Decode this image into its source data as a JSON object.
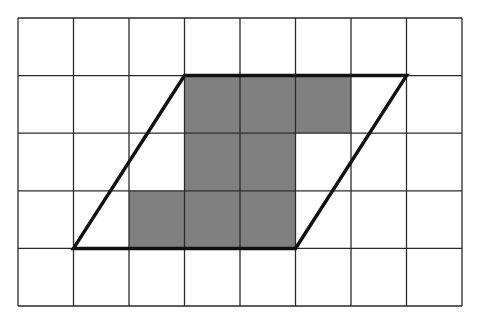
{
  "grid": {
    "cols": 8,
    "rows": 5,
    "origin_x": 18,
    "origin_y": 18,
    "cell_w": 55.5,
    "cell_h": 57.6,
    "line_color": "#2a2a2a",
    "background": "#ffffff"
  },
  "shaded_cells": [
    {
      "col": 3,
      "row": 1
    },
    {
      "col": 4,
      "row": 1
    },
    {
      "col": 5,
      "row": 1
    },
    {
      "col": 3,
      "row": 2
    },
    {
      "col": 4,
      "row": 2
    },
    {
      "col": 2,
      "row": 3
    },
    {
      "col": 3,
      "row": 3
    },
    {
      "col": 4,
      "row": 3
    }
  ],
  "shade_color": "#808080",
  "parallelogram": {
    "vertices": [
      [
        1,
        4
      ],
      [
        3,
        1
      ],
      [
        7,
        1
      ],
      [
        5,
        4
      ]
    ],
    "stroke": "#111111",
    "stroke_width": 3.5
  }
}
